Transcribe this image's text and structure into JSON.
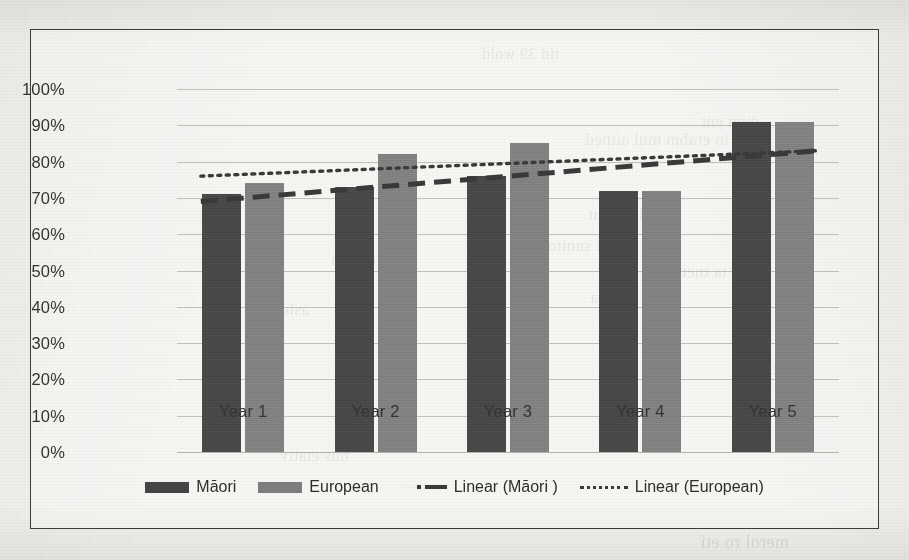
{
  "chart_data": {
    "type": "bar",
    "title": "",
    "xlabel": "",
    "ylabel": "",
    "categories": [
      "Year 1",
      "Year 2",
      "Year 3",
      "Year 4",
      "Year 5"
    ],
    "ylim": [
      0,
      100
    ],
    "ytick_labels": [
      "100%",
      "90%",
      "80%",
      "70%",
      "60%",
      "50%",
      "40%",
      "30%",
      "20%",
      "10%",
      "0%"
    ],
    "ytick_values": [
      100,
      90,
      80,
      70,
      60,
      50,
      40,
      30,
      20,
      10,
      0
    ],
    "grid": true,
    "legend_position": "bottom",
    "series": [
      {
        "name": "Māori",
        "kind": "bar",
        "color": "#454545",
        "values": [
          71,
          73,
          76,
          72,
          91
        ]
      },
      {
        "name": "European",
        "kind": "bar",
        "color": "#7e7e7e",
        "values": [
          74,
          82,
          85,
          72,
          91
        ]
      },
      {
        "name": "Linear (Māori )",
        "kind": "trendline",
        "style": "dashed",
        "color": "#3a3a3a",
        "endpoints": [
          69,
          83
        ]
      },
      {
        "name": "Linear (European)",
        "kind": "trendline",
        "style": "dotted",
        "color": "#3a3a3a",
        "endpoints": [
          76,
          83
        ]
      }
    ]
  },
  "legend": {
    "items": [
      {
        "label": "Māori",
        "marker": "bar-swatch-dark"
      },
      {
        "label": "European",
        "marker": "bar-swatch-gray"
      },
      {
        "label": "Linear (Māori )",
        "marker": "dashed-line"
      },
      {
        "label": "Linear (European)",
        "marker": "dotted-line"
      }
    ]
  },
  "scan_artifacts": {
    "bleed_through_lines": [
      "tid 39 wold",
      "qum ent",
      "io erabm mui aitned",
      "aimuloiv nut",
      "ei snoito",
      "uq ta tneuqerf",
      "tein umis a",
      "o etnom",
      "asiuq",
      "ni aitsuj",
      "merol ro eti",
      "nus etativ"
    ]
  }
}
